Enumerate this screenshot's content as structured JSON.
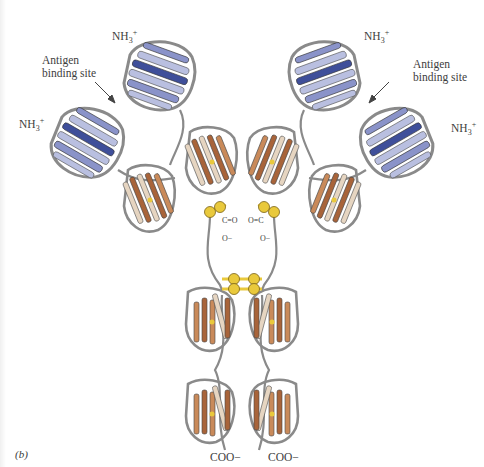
{
  "figure": {
    "panel_label": "(b)",
    "labels": {
      "nh3_top_left": {
        "base": "NH",
        "sub": "3",
        "sup": "+"
      },
      "nh3_mid_left": {
        "base": "NH",
        "sub": "3",
        "sup": "+"
      },
      "nh3_top_right": {
        "base": "NH",
        "sub": "3",
        "sup": "+"
      },
      "nh3_mid_right": {
        "base": "NH",
        "sub": "3",
        "sup": "+"
      },
      "antigen_left_line1": "Antigen",
      "antigen_left_line2": "binding site",
      "antigen_right_line1": "Antigen",
      "antigen_right_line2": "binding site",
      "carboxyl_left": "C=O",
      "carboxyl_left_o": "O−",
      "carboxyl_right": "O=C",
      "carboxyl_right_o": "O−",
      "coo_left": "COO−",
      "coo_right": "COO−",
      "disulfide_symbol": "S"
    },
    "colors": {
      "variable_light": "#b9bfe0",
      "variable_mid": "#8a93c9",
      "variable_dark": "#3f4f9a",
      "constant_light": "#e6d5c1",
      "constant_dark": "#a8643a",
      "loop_gray": "#8a8a8a",
      "disulfide_yellow": "#e9c93c"
    }
  }
}
